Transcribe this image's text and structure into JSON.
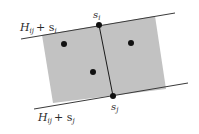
{
  "diagram": {
    "colors": {
      "background": "#ffffff",
      "region_fill": "#c2c2c2",
      "line": "#3a3a3a",
      "point": "#111111",
      "text": "#2a2a2a"
    },
    "hyperplanes": [
      {
        "id": "top",
        "label_main": "H",
        "label_sub": "ij",
        "label_plus": "+ s",
        "label_sub2": "i",
        "x1": 21,
        "y1": 39,
        "x2": 175,
        "y2": 13
      },
      {
        "id": "bottom",
        "label_main": "H",
        "label_sub": "ij",
        "label_plus": "+ s",
        "label_sub2": "j",
        "x1": 34,
        "y1": 109,
        "x2": 188,
        "y2": 83
      }
    ],
    "region": {
      "points": "42,35 155,16 166,89 53,103"
    },
    "divider": {
      "x1": 99,
      "y1": 25,
      "x2": 113,
      "y2": 96
    },
    "endpoints": [
      {
        "id": "s_i",
        "label": "s",
        "sub": "i",
        "x": 99,
        "y": 25
      },
      {
        "id": "s_j",
        "label": "s",
        "sub": "j",
        "x": 113,
        "y": 96
      }
    ],
    "points": [
      {
        "x": 64,
        "y": 44
      },
      {
        "x": 131,
        "y": 43
      },
      {
        "x": 93,
        "y": 72
      }
    ]
  }
}
